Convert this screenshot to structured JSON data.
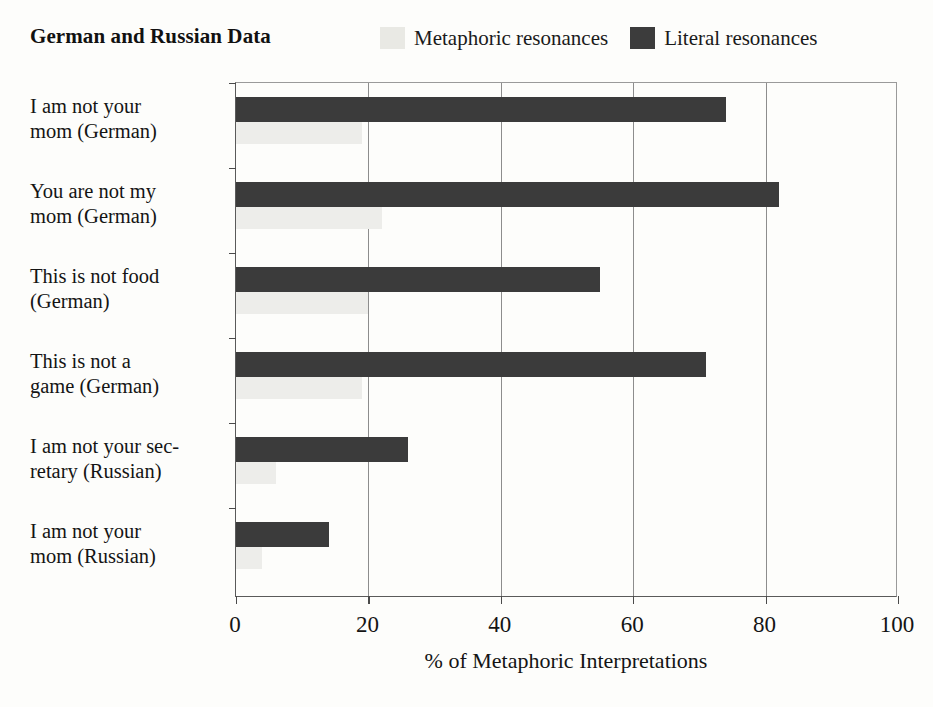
{
  "header": {
    "title": "German and Russian Data"
  },
  "legend": {
    "position": "top-right",
    "items": [
      {
        "label": "Metaphoric resonances",
        "color": "#e9e9e4",
        "key": "metaphoric"
      },
      {
        "label": "Literal resonances",
        "color": "#3c3c3c",
        "key": "literal"
      }
    ]
  },
  "chart_data": {
    "type": "bar",
    "orientation": "horizontal",
    "title": "German and Russian Data",
    "xlabel": "% of Metaphoric Interpretations",
    "ylabel": "",
    "xlim": [
      0,
      100
    ],
    "xticks": [
      0,
      20,
      40,
      60,
      80,
      100
    ],
    "xtick_labels": [
      "0",
      "20",
      "40",
      "60",
      "80",
      "100"
    ],
    "grid": "vertical-only",
    "legend_position": "top-right",
    "categories": [
      "I am not your mom (German)",
      "You are not my mom (German)",
      "This is not food (German)",
      "This is not a game (German)",
      "I am not your sec-retary (Russian)",
      "I am not your mom (Russian)"
    ],
    "category_lines": [
      [
        "I am not your",
        "mom (German)"
      ],
      [
        "You are not my",
        "mom (German)"
      ],
      [
        "This is not food",
        "(German)"
      ],
      [
        "This is not a",
        "game (German)"
      ],
      [
        "I am not your sec-",
        "retary (Russian)"
      ],
      [
        "I am not your",
        "mom (Russian)"
      ]
    ],
    "series": [
      {
        "name": "Literal resonances",
        "color": "#3b3b3b",
        "values": [
          74,
          82,
          55,
          71,
          26,
          14
        ]
      },
      {
        "name": "Metaphoric resonances",
        "color": "#ededea",
        "values": [
          19,
          22,
          20,
          19,
          6,
          4
        ]
      }
    ]
  },
  "axis": {
    "x_title": "% of Metaphoric Interpretations"
  }
}
